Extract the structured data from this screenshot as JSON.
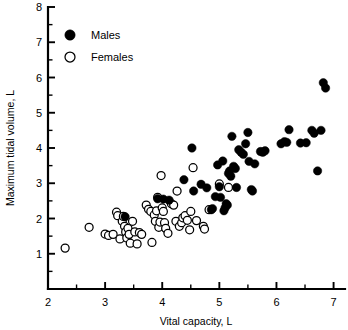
{
  "chart_data": {
    "type": "scatter",
    "title": "",
    "xlabel": "Vital capacity, L",
    "ylabel": "Maximum tidal volume, L",
    "xlim": [
      2,
      7.2
    ],
    "ylim": [
      0,
      8
    ],
    "xticks": [
      2,
      3,
      4,
      5,
      6,
      7
    ],
    "xticks_minor": [
      2.5,
      3.5,
      4.5,
      5.5,
      6.5
    ],
    "yticks": [
      1,
      2,
      3,
      4,
      5,
      6,
      7,
      8
    ],
    "yticks_minor": [
      0.5,
      1.5,
      2.5,
      3.5,
      4.5,
      5.5,
      6.5,
      7.5
    ],
    "xtick_labels": [
      "2",
      "3",
      "4",
      "5",
      "6",
      "7"
    ],
    "ytick_labels": [
      "1",
      "2",
      "3",
      "4",
      "5",
      "6",
      "7",
      "8"
    ],
    "grid": false,
    "legend_position": "upper-left",
    "legend": [
      {
        "name": "Males",
        "marker": "filled-circle",
        "color": "#000000"
      },
      {
        "name": "Females",
        "marker": "open-circle",
        "color": "#ffffff"
      }
    ],
    "series": [
      {
        "name": "Males",
        "marker": "filled-circle",
        "color": "#000000",
        "points": [
          [
            3.35,
            2.05
          ],
          [
            3.92,
            2.56
          ],
          [
            4.02,
            2.55
          ],
          [
            4.12,
            2.52
          ],
          [
            4.38,
            3.1
          ],
          [
            4.52,
            4.0
          ],
          [
            4.55,
            2.78
          ],
          [
            4.68,
            2.97
          ],
          [
            4.78,
            2.87
          ],
          [
            4.86,
            2.25
          ],
          [
            4.88,
            2.28
          ],
          [
            4.93,
            2.62
          ],
          [
            4.97,
            3.52
          ],
          [
            5.0,
            2.9
          ],
          [
            5.02,
            2.6
          ],
          [
            5.06,
            3.63
          ],
          [
            5.08,
            2.22
          ],
          [
            5.1,
            2.3
          ],
          [
            5.12,
            2.42
          ],
          [
            5.14,
            2.38
          ],
          [
            5.16,
            3.28
          ],
          [
            5.18,
            3.35
          ],
          [
            5.2,
            3.2
          ],
          [
            5.22,
            4.33
          ],
          [
            5.25,
            3.48
          ],
          [
            5.28,
            3.42
          ],
          [
            5.3,
            2.88
          ],
          [
            5.34,
            3.95
          ],
          [
            5.38,
            3.88
          ],
          [
            5.42,
            3.82
          ],
          [
            5.46,
            4.12
          ],
          [
            5.5,
            4.44
          ],
          [
            5.52,
            3.62
          ],
          [
            5.56,
            2.82
          ],
          [
            5.58,
            2.78
          ],
          [
            5.62,
            3.55
          ],
          [
            5.72,
            3.9
          ],
          [
            5.76,
            3.88
          ],
          [
            5.8,
            3.92
          ],
          [
            6.08,
            4.12
          ],
          [
            6.14,
            4.18
          ],
          [
            6.18,
            4.16
          ],
          [
            6.22,
            4.52
          ],
          [
            6.42,
            4.14
          ],
          [
            6.52,
            4.15
          ],
          [
            6.62,
            4.5
          ],
          [
            6.66,
            4.42
          ],
          [
            6.72,
            3.35
          ],
          [
            6.78,
            4.5
          ],
          [
            6.82,
            5.85
          ],
          [
            6.86,
            5.7
          ]
        ]
      },
      {
        "name": "Females",
        "marker": "open-circle",
        "color": "#ffffff",
        "points": [
          [
            2.3,
            1.16
          ],
          [
            2.72,
            1.75
          ],
          [
            3.0,
            1.56
          ],
          [
            3.06,
            1.52
          ],
          [
            3.14,
            1.55
          ],
          [
            3.2,
            2.18
          ],
          [
            3.22,
            2.08
          ],
          [
            3.26,
            1.42
          ],
          [
            3.3,
            1.92
          ],
          [
            3.32,
            2.06
          ],
          [
            3.34,
            1.78
          ],
          [
            3.36,
            1.62
          ],
          [
            3.38,
            1.45
          ],
          [
            3.4,
            1.72
          ],
          [
            3.42,
            1.55
          ],
          [
            3.44,
            1.3
          ],
          [
            3.48,
            1.92
          ],
          [
            3.52,
            1.62
          ],
          [
            3.56,
            1.28
          ],
          [
            3.6,
            1.6
          ],
          [
            3.64,
            1.55
          ],
          [
            3.72,
            2.38
          ],
          [
            3.76,
            2.26
          ],
          [
            3.8,
            2.2
          ],
          [
            3.82,
            1.32
          ],
          [
            3.86,
            2.1
          ],
          [
            3.88,
            1.92
          ],
          [
            3.9,
            2.22
          ],
          [
            3.92,
            2.6
          ],
          [
            3.94,
            1.75
          ],
          [
            3.96,
            1.9
          ],
          [
            3.98,
            3.22
          ],
          [
            4.0,
            2.3
          ],
          [
            4.02,
            2.2
          ],
          [
            4.04,
            1.88
          ],
          [
            4.06,
            1.72
          ],
          [
            4.1,
            1.58
          ],
          [
            4.16,
            2.42
          ],
          [
            4.2,
            2.38
          ],
          [
            4.24,
            1.92
          ],
          [
            4.26,
            2.78
          ],
          [
            4.3,
            1.78
          ],
          [
            4.34,
            1.88
          ],
          [
            4.36,
            2.02
          ],
          [
            4.4,
            2.08
          ],
          [
            4.44,
            1.95
          ],
          [
            4.48,
            1.68
          ],
          [
            4.5,
            2.2
          ],
          [
            4.54,
            3.44
          ],
          [
            4.6,
            1.94
          ],
          [
            4.72,
            1.78
          ],
          [
            4.74,
            1.7
          ],
          [
            4.82,
            2.25
          ],
          [
            5.0,
            2.98
          ],
          [
            5.16,
            2.88
          ]
        ]
      }
    ]
  }
}
